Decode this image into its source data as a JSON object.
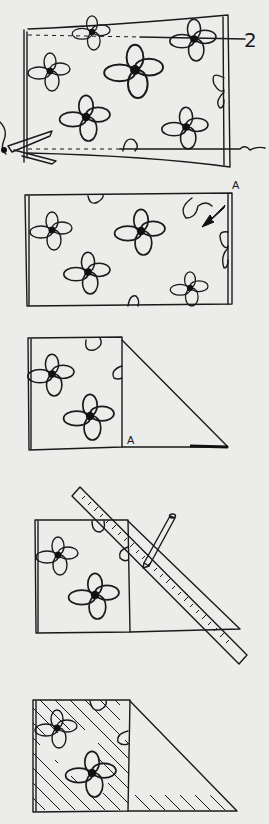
{
  "illustration": {
    "subject": "Fabric folding and marking instructions",
    "colors": {
      "ink": "#1a1a1a",
      "paper": "#ececea"
    },
    "steps": [
      {
        "index": 1,
        "description": "Straighten fabric edges by cutting along pulled thread lines",
        "labels": {
          "thread_marker": "2"
        },
        "icons": [
          "scissors-icon",
          "flower-pattern"
        ]
      },
      {
        "index": 2,
        "description": "Fold corner A down diagonally",
        "labels": {
          "corner": "A"
        },
        "icons": [
          "arrow-icon"
        ]
      },
      {
        "index": 3,
        "description": "Corner A folded to bottom edge forming a triangle",
        "labels": {
          "corner": "A"
        }
      },
      {
        "index": 4,
        "description": "Mark fold line with ruler and pencil",
        "icons": [
          "ruler-icon",
          "pencil-icon"
        ]
      },
      {
        "index": 5,
        "description": "Resulting square shaded with hatching",
        "icons": [
          "hatching"
        ]
      }
    ]
  }
}
